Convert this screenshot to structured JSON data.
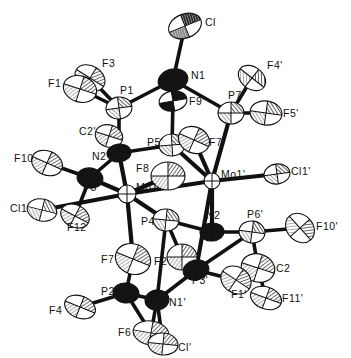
{
  "figure": {
    "type": "ortep-thermal-ellipsoid-plot",
    "title": "",
    "background_color": "#ffffff",
    "line_color": "#111111",
    "width": 351,
    "height": 358
  },
  "atoms": [
    {
      "id": "Cl",
      "label": "Cl",
      "x": 185,
      "y": 26,
      "rx": 17,
      "ry": 12,
      "rot": -22,
      "fill": "light",
      "hatch": "fine-dark",
      "label_dx": 20,
      "label_dy": -4
    },
    {
      "id": "N1",
      "label": "N1",
      "x": 173,
      "y": 80,
      "rx": 15,
      "ry": 11,
      "rot": -14,
      "fill": "dark",
      "hatch": "solid",
      "label_dx": 18,
      "label_dy": -5
    },
    {
      "id": "F9p",
      "label": "F9'",
      "x": 173,
      "y": 101,
      "rx": 14,
      "ry": 10,
      "rot": -10,
      "fill": "mid",
      "hatch": "solid",
      "label_dx": 16,
      "label_dy": 0
    },
    {
      "id": "F3",
      "label": "F3",
      "x": 90,
      "y": 78,
      "rx": 16,
      "ry": 12,
      "rot": 32,
      "fill": "light",
      "hatch": "dense",
      "label_dx": 12,
      "label_dy": -15
    },
    {
      "id": "F1",
      "label": "F1",
      "x": 80,
      "y": 89,
      "rx": 17,
      "ry": 13,
      "rot": 18,
      "fill": "light",
      "hatch": "dense",
      "label_dx": -32,
      "label_dy": -6
    },
    {
      "id": "P1",
      "label": "P1",
      "x": 119,
      "y": 108,
      "rx": 13,
      "ry": 11,
      "rot": -8,
      "fill": "light",
      "hatch": "half-dark",
      "label_dx": 1,
      "label_dy": -18
    },
    {
      "id": "F4p",
      "label": "F4'",
      "x": 252,
      "y": 78,
      "rx": 15,
      "ry": 11,
      "rot": 38,
      "fill": "light",
      "hatch": "half-dark",
      "label_dx": 15,
      "label_dy": -13
    },
    {
      "id": "P7p",
      "label": "P7'",
      "x": 231,
      "y": 113,
      "rx": 13,
      "ry": 11,
      "rot": 0,
      "fill": "light",
      "hatch": "half-dark",
      "label_dx": -3,
      "label_dy": -18
    },
    {
      "id": "F5p",
      "label": "F5'",
      "x": 266,
      "y": 113,
      "rx": 16,
      "ry": 12,
      "rot": 8,
      "fill": "light",
      "hatch": "half-dark",
      "label_dx": 17,
      "label_dy": 0
    },
    {
      "id": "C2p",
      "label": "C2'",
      "x": 109,
      "y": 136,
      "rx": 14,
      "ry": 11,
      "rot": 18,
      "fill": "light",
      "hatch": "dense",
      "label_dx": -30,
      "label_dy": -5
    },
    {
      "id": "N2p",
      "label": "N2'",
      "x": 119,
      "y": 153,
      "rx": 12,
      "ry": 9,
      "rot": -6,
      "fill": "dark",
      "hatch": "solid",
      "label_dx": -27,
      "label_dy": 3
    },
    {
      "id": "P5p",
      "label": "P5'",
      "x": 172,
      "y": 145,
      "rx": 13,
      "ry": 11,
      "rot": -4,
      "fill": "light",
      "hatch": "half-dark",
      "label_dx": -25,
      "label_dy": -3
    },
    {
      "id": "F7c",
      "label": "F7",
      "x": 194,
      "y": 140,
      "rx": 16,
      "ry": 13,
      "rot": 24,
      "fill": "light",
      "hatch": "dense",
      "label_dx": 15,
      "label_dy": 2
    },
    {
      "id": "F10",
      "label": "F10",
      "x": 47,
      "y": 163,
      "rx": 16,
      "ry": 12,
      "rot": 24,
      "fill": "light",
      "hatch": "dense",
      "label_dx": -33,
      "label_dy": -5
    },
    {
      "id": "P8",
      "label": "P8",
      "x": 90,
      "y": 178,
      "rx": 13,
      "ry": 10,
      "rot": 10,
      "fill": "dark",
      "hatch": "solid",
      "label_dx": -7,
      "label_dy": 9
    },
    {
      "id": "F8",
      "label": "F8",
      "x": 168,
      "y": 176,
      "rx": 17,
      "ry": 14,
      "rot": 0,
      "fill": "light",
      "hatch": "dense",
      "label_dx": -32,
      "label_dy": -8
    },
    {
      "id": "Mo1",
      "label": "Mo1",
      "x": 127,
      "y": 194,
      "rx": 9,
      "ry": 9,
      "rot": 0,
      "fill": "white",
      "hatch": "none",
      "label_dx": 9,
      "label_dy": -7
    },
    {
      "id": "Mo1p",
      "label": "Mo1'",
      "x": 212,
      "y": 181,
      "rx": 8,
      "ry": 8,
      "rot": 0,
      "fill": "white",
      "hatch": "none",
      "label_dx": 9,
      "label_dy": -7
    },
    {
      "id": "Cl1p",
      "label": "Cl1'",
      "x": 277,
      "y": 174,
      "rx": 13,
      "ry": 10,
      "rot": -8,
      "fill": "light",
      "hatch": "half-dark",
      "label_dx": 14,
      "label_dy": -3
    },
    {
      "id": "Cl1",
      "label": "Cl1",
      "x": 42,
      "y": 210,
      "rx": 15,
      "ry": 11,
      "rot": 14,
      "fill": "light",
      "hatch": "half-dark",
      "label_dx": -32,
      "label_dy": -2
    },
    {
      "id": "F12",
      "label": "F12",
      "x": 75,
      "y": 216,
      "rx": 15,
      "ry": 11,
      "rot": 28,
      "fill": "light",
      "hatch": "dense",
      "label_dx": -8,
      "label_dy": 11
    },
    {
      "id": "P4",
      "label": "P4",
      "x": 166,
      "y": 220,
      "rx": 13,
      "ry": 11,
      "rot": 6,
      "fill": "light",
      "hatch": "half-dark",
      "label_dx": -25,
      "label_dy": 1
    },
    {
      "id": "N2",
      "label": "N2",
      "x": 212,
      "y": 232,
      "rx": 12,
      "ry": 9,
      "rot": -4,
      "fill": "dark",
      "hatch": "solid",
      "label_dx": -6,
      "label_dy": -17
    },
    {
      "id": "P6p",
      "label": "P6'",
      "x": 252,
      "y": 232,
      "rx": 13,
      "ry": 11,
      "rot": 8,
      "fill": "light",
      "hatch": "half-dark",
      "label_dx": -5,
      "label_dy": -18
    },
    {
      "id": "F10p",
      "label": "F10'",
      "x": 300,
      "y": 228,
      "rx": 16,
      "ry": 13,
      "rot": 48,
      "fill": "light",
      "hatch": "dense",
      "label_dx": 16,
      "label_dy": -2
    },
    {
      "id": "F7b",
      "label": "F7",
      "x": 133,
      "y": 259,
      "rx": 18,
      "ry": 15,
      "rot": 22,
      "fill": "light",
      "hatch": "dense",
      "label_dx": -32,
      "label_dy": 0
    },
    {
      "id": "F2",
      "label": "F2",
      "x": 182,
      "y": 257,
      "rx": 15,
      "ry": 13,
      "rot": 0,
      "fill": "light",
      "hatch": "dense",
      "label_dx": -28,
      "label_dy": 4
    },
    {
      "id": "P3p",
      "label": "P3'",
      "x": 196,
      "y": 270,
      "rx": 13,
      "ry": 10,
      "rot": -14,
      "fill": "dark",
      "hatch": "solid",
      "label_dx": -4,
      "label_dy": 10
    },
    {
      "id": "C2",
      "label": "C2",
      "x": 258,
      "y": 268,
      "rx": 17,
      "ry": 14,
      "rot": 18,
      "fill": "light",
      "hatch": "dense",
      "label_dx": 18,
      "label_dy": 0
    },
    {
      "id": "F1p",
      "label": "F1'",
      "x": 236,
      "y": 280,
      "rx": 16,
      "ry": 13,
      "rot": 34,
      "fill": "light",
      "hatch": "dense",
      "label_dx": -5,
      "label_dy": 14
    },
    {
      "id": "F11p",
      "label": "F11'",
      "x": 266,
      "y": 298,
      "rx": 16,
      "ry": 11,
      "rot": 20,
      "fill": "light",
      "hatch": "dense",
      "label_dx": 16,
      "label_dy": 0
    },
    {
      "id": "P2",
      "label": "P2",
      "x": 126,
      "y": 293,
      "rx": 13,
      "ry": 10,
      "rot": 6,
      "fill": "dark",
      "hatch": "solid",
      "label_dx": -25,
      "label_dy": -2
    },
    {
      "id": "F4",
      "label": "F4",
      "x": 80,
      "y": 307,
      "rx": 16,
      "ry": 11,
      "rot": 22,
      "fill": "light",
      "hatch": "dense",
      "label_dx": -31,
      "label_dy": 3
    },
    {
      "id": "N1p",
      "label": "N1'",
      "x": 157,
      "y": 300,
      "rx": 12,
      "ry": 10,
      "rot": -8,
      "fill": "dark",
      "hatch": "solid",
      "label_dx": 12,
      "label_dy": 2
    },
    {
      "id": "F6",
      "label": "F6",
      "x": 151,
      "y": 333,
      "rx": 18,
      "ry": 12,
      "rot": 10,
      "fill": "light",
      "hatch": "dense",
      "label_dx": -33,
      "label_dy": -1
    },
    {
      "id": "Clp",
      "label": "Cl'",
      "x": 163,
      "y": 344,
      "rx": 15,
      "ry": 11,
      "rot": 6,
      "fill": "light",
      "hatch": "dense",
      "label_dx": 15,
      "label_dy": 3
    }
  ],
  "bonds": [
    [
      "Cl",
      "N1"
    ],
    [
      "N1",
      "P1"
    ],
    [
      "N1",
      "P7p"
    ],
    [
      "N1",
      "F9p"
    ],
    [
      "F9p",
      "P5p"
    ],
    [
      "P1",
      "F1"
    ],
    [
      "P1",
      "F3"
    ],
    [
      "P1",
      "N2p"
    ],
    [
      "P7p",
      "F4p"
    ],
    [
      "P7p",
      "F5p"
    ],
    [
      "P7p",
      "Mo1p"
    ],
    [
      "P5p",
      "N2p"
    ],
    [
      "P5p",
      "Mo1p"
    ],
    [
      "F7c",
      "Mo1p"
    ],
    [
      "N2p",
      "C2p"
    ],
    [
      "N2p",
      "P8"
    ],
    [
      "N2p",
      "Mo1"
    ],
    [
      "P8",
      "F10"
    ],
    [
      "P8",
      "Mo1"
    ],
    [
      "P8",
      "F12"
    ],
    [
      "Mo1",
      "Cl1"
    ],
    [
      "Mo1",
      "F8"
    ],
    [
      "Mo1",
      "P4"
    ],
    [
      "Mo1",
      "Mo1p"
    ],
    [
      "Mo1",
      "F7b"
    ],
    [
      "Mo1p",
      "Cl1p"
    ],
    [
      "Mo1p",
      "N2"
    ],
    [
      "Mo1p",
      "P3p"
    ],
    [
      "P4",
      "N2"
    ],
    [
      "P4",
      "F2"
    ],
    [
      "P4",
      "N1p"
    ],
    [
      "N2",
      "P6p"
    ],
    [
      "P6p",
      "F10p"
    ],
    [
      "P6p",
      "C2"
    ],
    [
      "P6p",
      "P3p"
    ],
    [
      "P3p",
      "F2"
    ],
    [
      "P3p",
      "N1p"
    ],
    [
      "P3p",
      "F1p"
    ],
    [
      "C2",
      "F11p"
    ],
    [
      "C2",
      "F1p"
    ],
    [
      "F7b",
      "P2"
    ],
    [
      "P2",
      "F4"
    ],
    [
      "P2",
      "N1p"
    ],
    [
      "P2",
      "F6"
    ],
    [
      "N1p",
      "Clp"
    ],
    [
      "N1p",
      "F6"
    ]
  ]
}
